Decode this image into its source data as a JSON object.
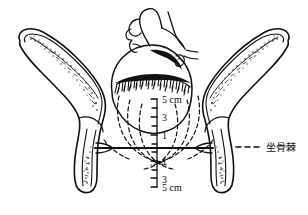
{
  "figure": {
    "type": "anatomical-line-drawing",
    "background_color": "#ffffff",
    "ink_color": "#111111"
  },
  "callout": {
    "label": "坐骨棘",
    "leader_style": "dashed"
  },
  "scale": {
    "axis_orientation": "vertical",
    "unit": "cm",
    "zero_reference": "interspinous line",
    "ticks": [
      {
        "value": 5,
        "label": "5 cm",
        "side": "above"
      },
      {
        "value": 4,
        "label": "",
        "side": "above"
      },
      {
        "value": 3,
        "label": "3",
        "side": "above"
      },
      {
        "value": 2,
        "label": "",
        "side": "above"
      },
      {
        "value": 1,
        "label": "1",
        "side": "above"
      },
      {
        "value": 0,
        "label": "",
        "side": "zero"
      },
      {
        "value": -1,
        "label": "1",
        "side": "below"
      },
      {
        "value": -2,
        "label": "",
        "side": "below"
      },
      {
        "value": -3,
        "label": "3",
        "side": "below"
      },
      {
        "value": -4,
        "label": "",
        "side": "below"
      },
      {
        "value": -5,
        "label": "5 cm",
        "side": "below"
      }
    ]
  },
  "parts": {
    "left_pelvic_bone": "left innominate bone",
    "right_pelvic_bone": "right innominate bone",
    "fetal_head": "fetal head in profile",
    "interspinous_line": "interspinous (ischial spine) line",
    "station_arcs": "dashed descent station arcs"
  }
}
